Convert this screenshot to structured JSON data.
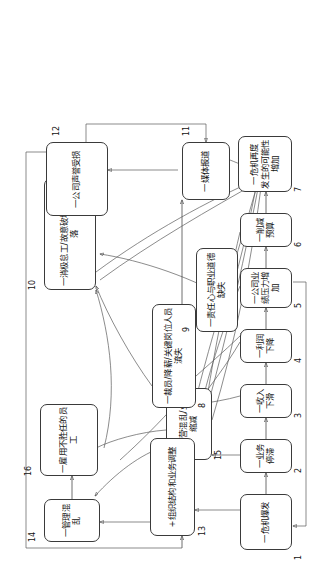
{
  "diagram": {
    "orientation": "rotated-90-ccw",
    "line_color": "#4a4a4a",
    "box_border_color": "#3a3a3a",
    "box_fill": "#ffffff"
  },
  "nodes": [
    {
      "id": "1",
      "index": "1",
      "label": "一危机爆发",
      "line1": "一危机爆发",
      "line2": ""
    },
    {
      "id": "2",
      "index": "2",
      "label": "一业务停滞",
      "line1": "一业务停滞",
      "line2": ""
    },
    {
      "id": "3",
      "index": "3",
      "label": "一收入下滑",
      "line1": "一收入下滑",
      "line2": ""
    },
    {
      "id": "4",
      "index": "4",
      "label": "一利润下降",
      "line1": "一利润下降",
      "line2": ""
    },
    {
      "id": "5",
      "index": "5",
      "label": "一公司业绩压力增加",
      "line1": "一公司业绩压力增加",
      "line2": ""
    },
    {
      "id": "6",
      "index": "6",
      "label": "一削减预算",
      "line1": "一削减预算",
      "line2": ""
    },
    {
      "id": "7",
      "index": "7",
      "label": "一危机再度发生的可能性增加",
      "line1": "一危机再度",
      "line2": "发生的可能性增加"
    },
    {
      "id": "8",
      "index": "8",
      "label": "一裁员/降薪/关键岗位人员流失",
      "line1": "一裁员/降薪/关键岗位人员流失",
      "line2": ""
    },
    {
      "id": "9",
      "index": "9",
      "label": "一责任心与职业道德缺失",
      "line1": "一责任心与职业道德缺失",
      "line2": ""
    },
    {
      "id": "10",
      "index": "10",
      "label": "一消极怠工/故意破坏/士气低落",
      "line1": "一消极怠工/故意破坏/士气低落",
      "line2": ""
    },
    {
      "id": "11",
      "index": "11",
      "label": "一媒体报道",
      "line1": "一媒体报道",
      "line2": ""
    },
    {
      "id": "12",
      "index": "12",
      "label": "一公司声誉受损",
      "line1": "一公司声誉受损",
      "line2": ""
    },
    {
      "id": "13",
      "index": "13",
      "label": "+组织结构和业务调整",
      "line1": "+组织结构和业务调整",
      "line2": ""
    },
    {
      "id": "14",
      "index": "14",
      "label": "一管理混乱",
      "line1": "一管理混乱",
      "line2": ""
    },
    {
      "id": "15",
      "index": "15",
      "label": "一经营混乱/业务缩减",
      "line1": "一经营混乱/业务缩减",
      "line2": ""
    },
    {
      "id": "16",
      "index": "16",
      "label": "一雇用不胜任的员工",
      "line1": "一雇用不胜任的员工",
      "line2": ""
    }
  ]
}
